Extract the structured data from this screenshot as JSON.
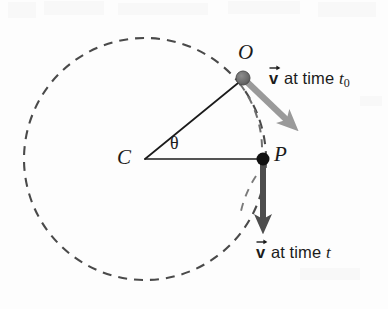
{
  "figure": {
    "background_color": "#fdfdfd",
    "width": 388,
    "height": 309
  },
  "colors": {
    "circle_dashed": "#4a4a4a",
    "radius_line": "#1b1b1b",
    "vector_t0": "#9a9a9a",
    "vector_t": "#4d4d4d",
    "point_o": "#6e6e6e",
    "point_p": "#111111",
    "text": "#1b1b1b"
  },
  "circle": {
    "name": "dashed-orbit-circle",
    "center_x": 145,
    "center_y": 159,
    "radius": 121,
    "stroke_width": 2.1,
    "dash_pattern": "9 7",
    "style": "dashed"
  },
  "points": [
    {
      "id": "C",
      "label": "C",
      "role": "center-of-circle",
      "x": 145,
      "y": 159,
      "label_x": 120,
      "label_y": 148,
      "marker": "none"
    },
    {
      "id": "O",
      "label": "O",
      "role": "position-at-time-t0",
      "x": 243,
      "y": 78,
      "label_x": 238,
      "label_y": 47,
      "marker": "filled-gray-dot",
      "marker_radius": 7
    },
    {
      "id": "P",
      "label": "P",
      "role": "position-at-time-t",
      "x": 263,
      "y": 159,
      "label_x": 273,
      "label_y": 146,
      "marker": "filled-black-dot",
      "marker_radius": 6.5
    }
  ],
  "angle": {
    "symbol": "θ",
    "name": "theta",
    "vertex": "C",
    "between": [
      "C-O",
      "C-P"
    ],
    "label_x": 172,
    "label_y": 143,
    "arc_radius": 34
  },
  "radius_lines": [
    {
      "name": "radius-C-to-O",
      "from": "C",
      "to": "O",
      "x1": 145,
      "y1": 159,
      "x2": 243,
      "y2": 78,
      "stroke_width": 1.7
    },
    {
      "name": "radius-C-to-P",
      "from": "C",
      "to": "P",
      "x1": 145,
      "y1": 159,
      "x2": 263,
      "y2": 159,
      "stroke_width": 1.7
    }
  ],
  "vectors": [
    {
      "id": "v-t0",
      "name": "velocity-vector-at-t0",
      "origin": "O",
      "x1": 245,
      "y1": 81,
      "x2": 297,
      "y2": 130,
      "color": "#9a9a9a",
      "stroke_width": 6.5,
      "direction": "tangent down-right",
      "label": {
        "prefix": "v",
        "vector_notation": true,
        "middle": " at time ",
        "variable": "t",
        "subscript": "0",
        "text": "v at time t0",
        "x": 269,
        "y": 73
      }
    },
    {
      "id": "v-t",
      "name": "velocity-vector-at-t",
      "origin": "P",
      "x1": 263,
      "y1": 162,
      "x2": 263,
      "y2": 234,
      "color": "#4d4d4d",
      "stroke_width": 6.0,
      "direction": "tangent straight down",
      "label": {
        "prefix": "v",
        "vector_notation": true,
        "middle": " at time ",
        "variable": "t",
        "subscript": "",
        "text": "v at time t",
        "x": 257,
        "y": 246
      }
    }
  ],
  "guide_arc": {
    "name": "dashed-arc-O-to-P",
    "description": "dashed arc segment of circle between O and P",
    "visible": true
  }
}
